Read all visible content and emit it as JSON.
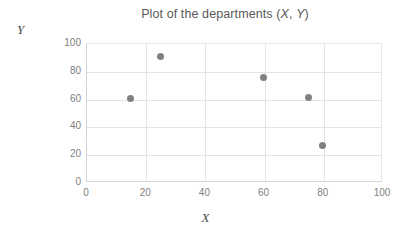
{
  "chart_data": {
    "type": "scatter",
    "title": "Plot of the departments (X, Y)",
    "title_prefix": "Plot of the departments (",
    "title_var_x": "X",
    "title_sep": ", ",
    "title_var_y": "Y",
    "title_suffix": ")",
    "xlabel": "X",
    "ylabel": "Y",
    "xlim": [
      0,
      100
    ],
    "ylim": [
      0,
      100
    ],
    "xticks": [
      "0",
      "20",
      "40",
      "60",
      "80",
      "100"
    ],
    "yticks": [
      "0",
      "20",
      "40",
      "60",
      "80",
      "100"
    ],
    "grid": true,
    "legend": "none",
    "point_color": "#808080",
    "points": [
      {
        "x": 15,
        "y": 60
      },
      {
        "x": 25,
        "y": 90
      },
      {
        "x": 60,
        "y": 75
      },
      {
        "x": 75,
        "y": 60.5
      },
      {
        "x": 80,
        "y": 26
      }
    ]
  },
  "colors": {
    "background": "#ffffff",
    "gridline": "#e4e4e4",
    "axis": "#d4d4d4",
    "tick_text": "#7f7f7f",
    "title_text": "#595959",
    "axis_title_text": "#4a4a4a",
    "marker": "#808080"
  }
}
